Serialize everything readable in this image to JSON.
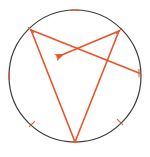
{
  "figure": {
    "background_color": "#ffffff",
    "width": 150,
    "height": 157
  },
  "circle": {
    "name": "circumscribed-circle",
    "center_x": 75,
    "center_y": 76,
    "radius": 66,
    "stroke_color": "#3a3a3a",
    "stroke_width": 1.2,
    "fill": "none"
  },
  "chord_color": "#e8542a",
  "chord_width": 1.6,
  "points": [
    {
      "id": "A",
      "label": "",
      "x": 31,
      "y": 30,
      "on_circle": true,
      "tick": true
    },
    {
      "id": "B",
      "label": "",
      "x": 119,
      "y": 31,
      "on_circle": true,
      "tick": true
    },
    {
      "id": "C",
      "label": "",
      "x": 75,
      "y": 142,
      "on_circle": true,
      "tick": true
    },
    {
      "id": "D",
      "label": "",
      "x": 139,
      "y": 73,
      "on_circle": true,
      "tick": true
    },
    {
      "id": "T_top",
      "label": "",
      "x": 75,
      "y": 10,
      "on_circle": true,
      "tick": true
    },
    {
      "id": "T_left",
      "label": "",
      "x": 9,
      "y": 76,
      "on_circle": true,
      "tick": true
    },
    {
      "id": "T_lower_left",
      "label": "",
      "x": 32,
      "y": 124,
      "on_circle": true,
      "tick": true
    },
    {
      "id": "T_lower_right",
      "label": "",
      "x": 120,
      "y": 122,
      "on_circle": true,
      "tick": true
    }
  ],
  "tick_marks": [
    {
      "name": "tick-top",
      "x": 75,
      "y": 10,
      "angle_deg": 0
    },
    {
      "name": "tick-left",
      "x": 9,
      "y": 76,
      "angle_deg": 90
    },
    {
      "name": "tick-right",
      "x": 139,
      "y": 73,
      "angle_deg": 90
    },
    {
      "name": "tick-upper-left-vertex",
      "x": 31,
      "y": 30,
      "angle_deg": 45
    },
    {
      "name": "tick-upper-right-vertex",
      "x": 119,
      "y": 31,
      "angle_deg": -45
    },
    {
      "name": "tick-lower-left",
      "x": 32,
      "y": 124,
      "angle_deg": -45
    },
    {
      "name": "tick-lower-right",
      "x": 120,
      "y": 122,
      "angle_deg": 45
    },
    {
      "name": "tick-bottom-vertex",
      "x": 75,
      "y": 142,
      "angle_deg": 0
    }
  ],
  "segments": [
    {
      "name": "chord-upper-left-to-bottom",
      "x1": 31,
      "y1": 30,
      "x2": 75,
      "y2": 142,
      "arrow": false
    },
    {
      "name": "chord-upper-left-to-right",
      "x1": 31,
      "y1": 30,
      "x2": 139,
      "y2": 73,
      "arrow": false
    },
    {
      "name": "chord-upper-right-to-bottom",
      "x1": 119,
      "y1": 31,
      "x2": 75,
      "y2": 142,
      "arrow": false
    }
  ],
  "arrow_segment": {
    "name": "vector-arrow-upper-right-to-lower-left",
    "x1": 119,
    "y1": 31,
    "x2": 57,
    "y2": 57,
    "head_length": 9,
    "head_width": 5,
    "direction": "down-left"
  },
  "intersection": {
    "name": "chord-intersection-point",
    "x": 76,
    "y": 48
  }
}
